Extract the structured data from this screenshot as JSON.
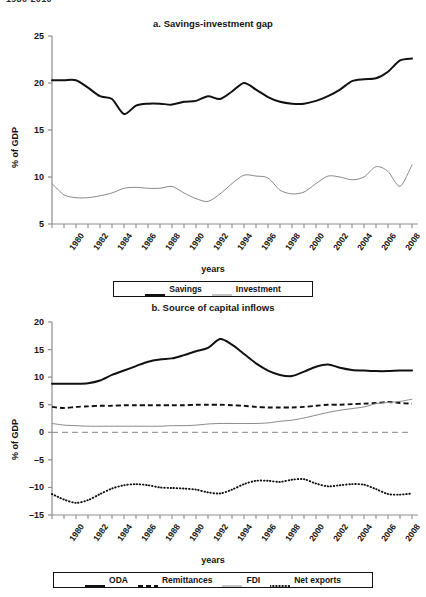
{
  "page": {
    "clipped_header": "1980-2010"
  },
  "panel_a": {
    "title": "a. Savings-investment gap",
    "ylabel": "% of GDP",
    "xlabel": "years",
    "legend": [
      {
        "label": "Savings",
        "style": "solid-thick",
        "color": "#111111"
      },
      {
        "label": "Investment",
        "style": "solid-thin",
        "color": "#8a8a8a"
      }
    ]
  },
  "panel_b": {
    "title": "b. Source of capital inflows",
    "ylabel": "% of GDP",
    "xlabel": "years",
    "legend": [
      {
        "label": "ODA",
        "style": "solid-thick",
        "color": "#111111"
      },
      {
        "label": "Remittances",
        "style": "dashed",
        "color": "#111111"
      },
      {
        "label": "FDI",
        "style": "solid-thin",
        "color": "#8a8a8a"
      },
      {
        "label": "Net exports",
        "style": "dotted",
        "color": "#111111"
      }
    ]
  },
  "chart_data": [
    {
      "id": "panel-a",
      "type": "line",
      "title": "a. Savings-investment gap",
      "xlabel": "years",
      "ylabel": "% of GDP",
      "ylim": [
        5,
        25
      ],
      "yticks": [
        5,
        10,
        15,
        20,
        25
      ],
      "xlim": [
        1980,
        2010
      ],
      "xticks": [
        1980,
        1982,
        1984,
        1986,
        1988,
        1990,
        1992,
        1994,
        1996,
        1998,
        2000,
        2002,
        2004,
        2006,
        2008,
        2010
      ],
      "grid": false,
      "legend_position": "bottom",
      "x": [
        1980,
        1981,
        1982,
        1983,
        1984,
        1985,
        1986,
        1987,
        1988,
        1989,
        1990,
        1991,
        1992,
        1993,
        1994,
        1995,
        1996,
        1997,
        1998,
        1999,
        2000,
        2001,
        2002,
        2003,
        2004,
        2005,
        2006,
        2007,
        2008,
        2009,
        2010
      ],
      "series": [
        {
          "name": "Savings",
          "color": "#111111",
          "style": "solid-thick",
          "values": [
            20.3,
            20.3,
            20.3,
            19.5,
            18.6,
            18.3,
            16.7,
            17.6,
            17.8,
            17.8,
            17.7,
            18.0,
            18.1,
            18.6,
            18.3,
            19.1,
            20.0,
            19.3,
            18.5,
            18.0,
            17.8,
            17.8,
            18.1,
            18.6,
            19.3,
            20.2,
            20.4,
            20.5,
            21.2,
            22.4,
            22.6
          ]
        },
        {
          "name": "Investment",
          "color": "#8a8a8a",
          "style": "solid-thin",
          "values": [
            9.3,
            8.1,
            7.8,
            7.8,
            8.0,
            8.3,
            8.8,
            8.9,
            8.8,
            8.8,
            9.0,
            8.3,
            7.7,
            7.4,
            8.2,
            9.3,
            10.2,
            10.1,
            9.9,
            8.6,
            8.2,
            8.4,
            9.3,
            10.1,
            10.0,
            9.7,
            10.0,
            11.1,
            10.6,
            9.0,
            11.3
          ]
        }
      ]
    },
    {
      "id": "panel-b",
      "type": "line",
      "title": "b. Source of capital inflows",
      "xlabel": "years",
      "ylabel": "% of GDP",
      "ylim": [
        -15,
        20
      ],
      "yticks": [
        -15,
        -10,
        -5,
        0,
        5,
        10,
        15,
        20
      ],
      "xlim": [
        1980,
        2010
      ],
      "xticks": [
        1980,
        1982,
        1984,
        1986,
        1988,
        1990,
        1992,
        1994,
        1996,
        1998,
        2000,
        2002,
        2004,
        2006,
        2008,
        2010
      ],
      "grid": false,
      "zero_line": true,
      "legend_position": "bottom",
      "x": [
        1980,
        1981,
        1982,
        1983,
        1984,
        1985,
        1986,
        1987,
        1988,
        1989,
        1990,
        1991,
        1992,
        1993,
        1994,
        1995,
        1996,
        1997,
        1998,
        1999,
        2000,
        2001,
        2002,
        2003,
        2004,
        2005,
        2006,
        2007,
        2008,
        2009,
        2010
      ],
      "series": [
        {
          "name": "ODA",
          "color": "#111111",
          "style": "solid-thick",
          "values": [
            8.8,
            8.8,
            8.8,
            8.9,
            9.4,
            10.4,
            11.2,
            12.0,
            12.8,
            13.2,
            13.4,
            14.0,
            14.7,
            15.3,
            16.9,
            15.9,
            14.2,
            12.5,
            11.2,
            10.4,
            10.2,
            11.0,
            11.9,
            12.3,
            11.7,
            11.3,
            11.2,
            11.1,
            11.1,
            11.2,
            11.2
          ]
        },
        {
          "name": "Remittances",
          "color": "#111111",
          "style": "dashed",
          "values": [
            4.6,
            4.4,
            4.6,
            4.7,
            4.8,
            4.8,
            4.9,
            4.9,
            4.9,
            4.9,
            4.9,
            4.9,
            5.0,
            5.0,
            5.0,
            4.9,
            4.8,
            4.6,
            4.5,
            4.5,
            4.5,
            4.6,
            4.8,
            5.0,
            5.0,
            5.1,
            5.2,
            5.3,
            5.5,
            5.3,
            5.2
          ]
        },
        {
          "name": "FDI",
          "color": "#8a8a8a",
          "style": "solid-thin",
          "values": [
            1.6,
            1.3,
            1.2,
            1.1,
            1.1,
            1.1,
            1.1,
            1.1,
            1.1,
            1.1,
            1.2,
            1.2,
            1.3,
            1.5,
            1.6,
            1.6,
            1.6,
            1.6,
            1.7,
            2.0,
            2.2,
            2.6,
            3.1,
            3.6,
            4.0,
            4.3,
            4.6,
            5.2,
            5.4,
            5.6,
            6.0
          ]
        },
        {
          "name": "Net exports",
          "color": "#111111",
          "style": "dotted",
          "values": [
            -11.2,
            -12.2,
            -12.8,
            -12.3,
            -11.2,
            -10.2,
            -9.6,
            -9.4,
            -9.6,
            -10.0,
            -10.1,
            -10.2,
            -10.4,
            -10.9,
            -11.1,
            -10.4,
            -9.4,
            -8.8,
            -8.8,
            -9.0,
            -8.6,
            -8.5,
            -9.3,
            -9.8,
            -9.6,
            -9.4,
            -9.5,
            -10.3,
            -11.2,
            -11.3,
            -11.1
          ]
        }
      ]
    }
  ]
}
